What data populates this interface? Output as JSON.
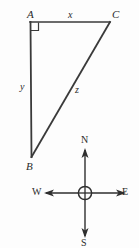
{
  "figure": {
    "stroke_color": "#3a3a3a",
    "text_color": "#2b2b2b",
    "background_color": "#fdfdfd"
  },
  "triangle": {
    "vertices": [
      {
        "name": "A",
        "label": "A",
        "x": 30,
        "y": 22,
        "corner": "top-left"
      },
      {
        "name": "C",
        "label": "C",
        "x": 110,
        "y": 22,
        "corner": "top-right"
      },
      {
        "name": "B",
        "label": "B",
        "x": 31,
        "y": 156,
        "corner": "bottom-left"
      }
    ],
    "sides": [
      {
        "name": "AC",
        "label": "x",
        "from": "A",
        "to": "C"
      },
      {
        "name": "AB",
        "label": "y",
        "from": "A",
        "to": "B"
      },
      {
        "name": "BC",
        "label": "z",
        "from": "B",
        "to": "C"
      }
    ],
    "right_angle_at": "A",
    "right_angle_marker": "square"
  },
  "compass": {
    "center_x": 85,
    "center_y": 193,
    "directions": [
      {
        "name": "north",
        "label": "N"
      },
      {
        "name": "east",
        "label": "E"
      },
      {
        "name": "south",
        "label": "S"
      },
      {
        "name": "west",
        "label": "W"
      }
    ]
  }
}
